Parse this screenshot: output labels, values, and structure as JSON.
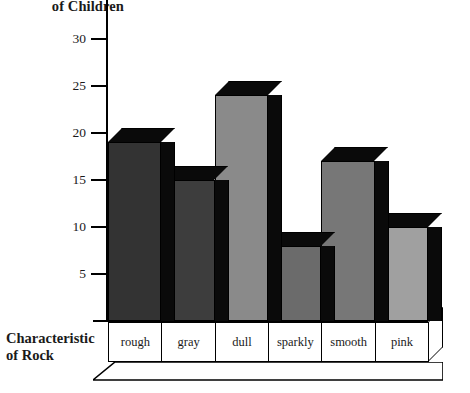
{
  "chart_data": {
    "type": "bar",
    "title": "",
    "categories": [
      "rough",
      "gray",
      "dull",
      "sparkly",
      "smooth",
      "pink"
    ],
    "values": [
      19,
      15,
      24,
      8,
      17,
      10
    ],
    "series": [
      {
        "name": "Number of Children",
        "values": [
          19,
          15,
          24,
          8,
          17,
          10
        ]
      }
    ],
    "ylabel": "of Children",
    "xlabel": "Characteristic\nof Rock",
    "ylim": [
      0,
      32
    ],
    "yticks": [
      5,
      10,
      15,
      20,
      25,
      30
    ],
    "ytick_labels": [
      "5",
      "10",
      "15",
      "20",
      "25",
      "30"
    ],
    "grid": false,
    "legend": "none",
    "bar_colors": [
      "#333333",
      "#3d3d3d",
      "#8a8a8a",
      "#6b6b6b",
      "#777777",
      "#a0a0a0"
    ],
    "side_color": "#0a0a0a",
    "axis_color": "#000000"
  },
  "axis": {
    "ylabel": "of Children",
    "xlabel": "Characteristic\nof Rock"
  }
}
